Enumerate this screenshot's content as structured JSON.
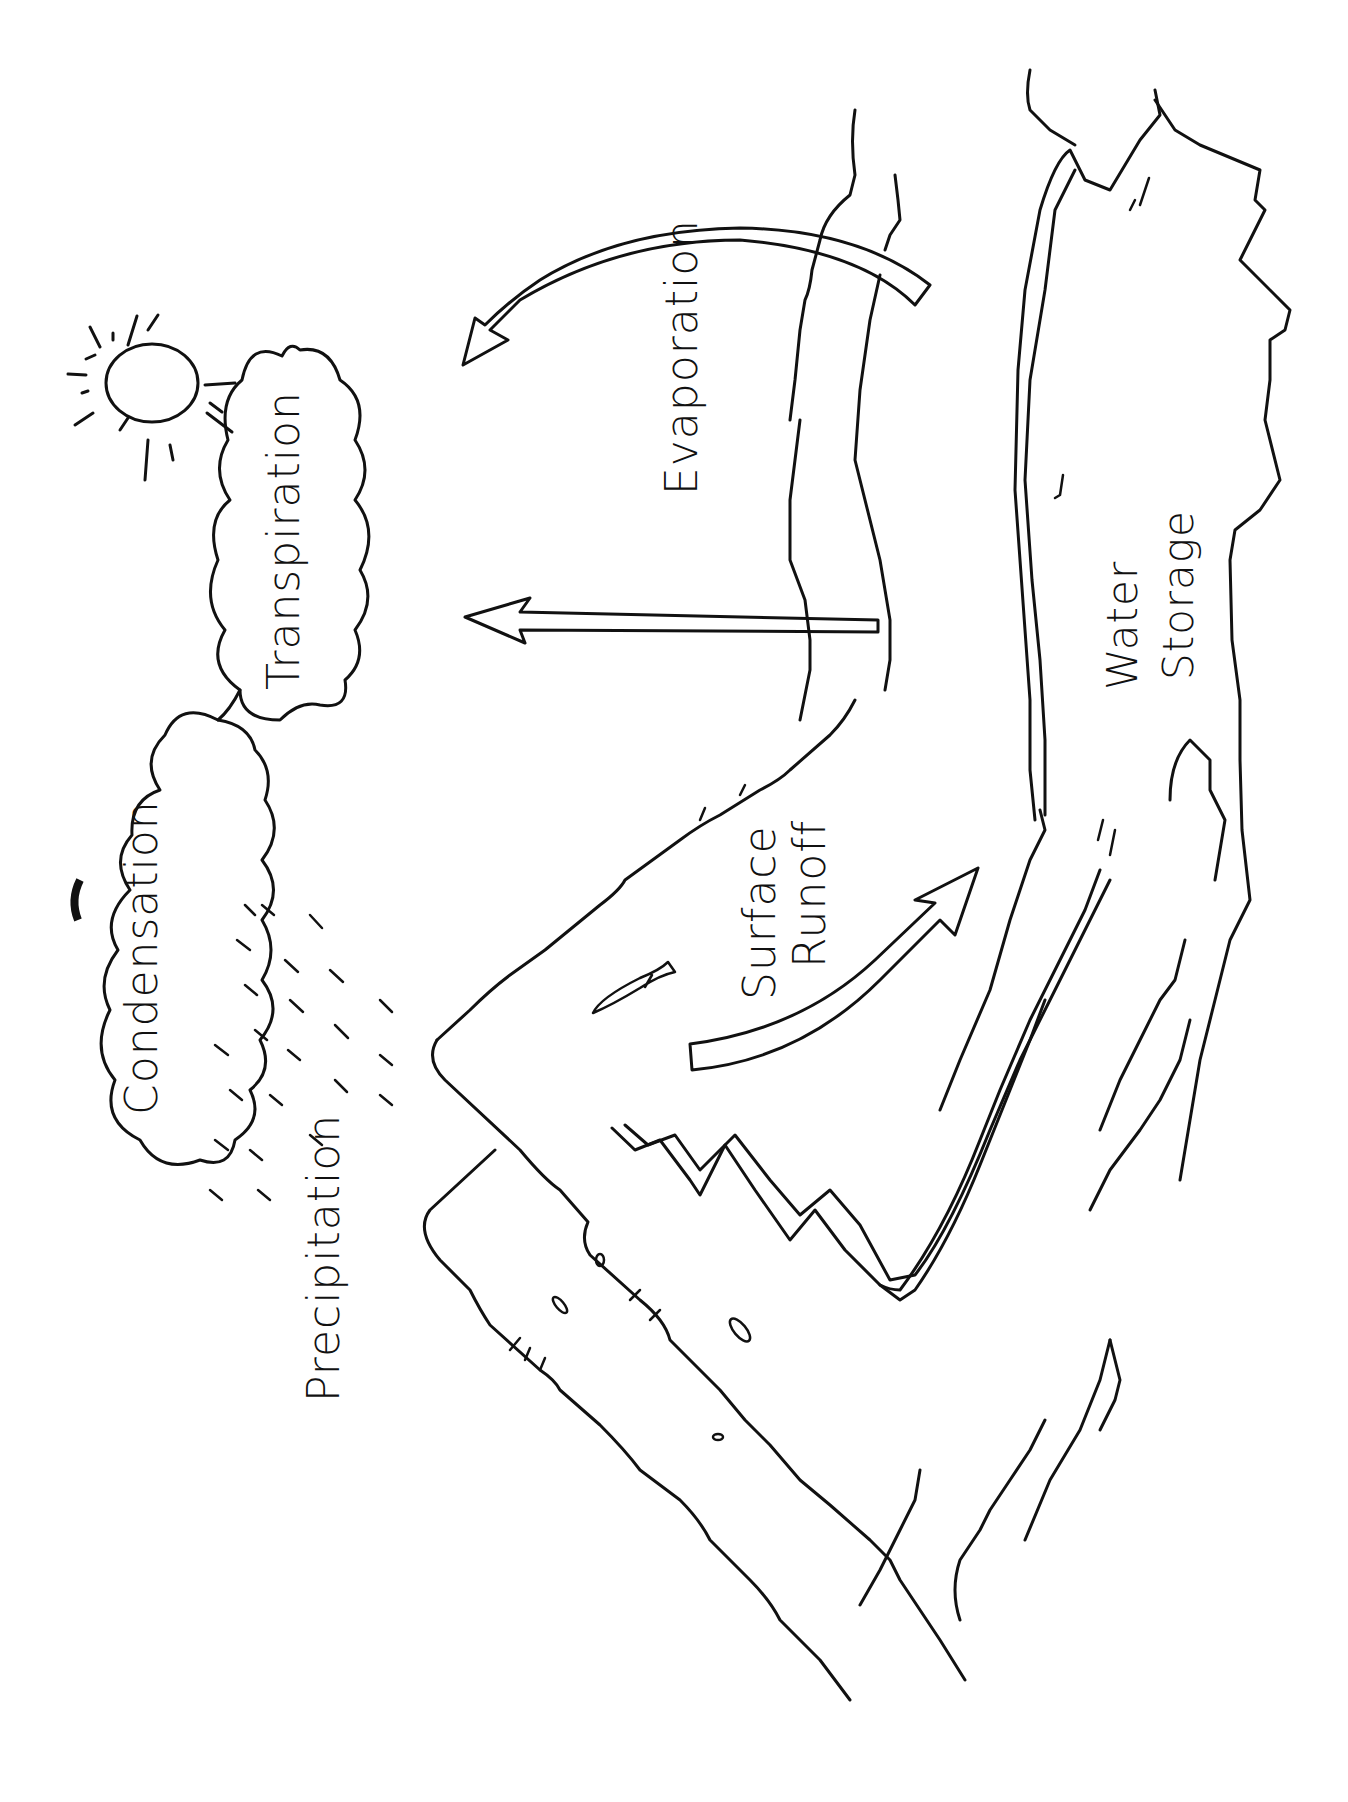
{
  "diagram": {
    "orientation": "rotated 90 degrees counter-clockwise",
    "style": "black ink line drawing on white",
    "colors": {
      "ink": "#111111",
      "background": "#ffffff"
    },
    "labels": {
      "condensation": "Condensation",
      "transpiration": "Transpiration",
      "evaporation": "Evaporation",
      "precipitation": "Precipitation",
      "surface_runoff_line1": "Surface",
      "surface_runoff_line2": "Runoff",
      "water_storage_line1": "Water",
      "water_storage_line2": "Storage"
    },
    "elements": [
      "sun-icon",
      "condensation-cloud",
      "transpiration-cloud",
      "rain-streaks",
      "mountain",
      "river",
      "lake",
      "bird",
      "evaporation-arrow",
      "transpiration-arrow",
      "runoff-arrow"
    ]
  }
}
